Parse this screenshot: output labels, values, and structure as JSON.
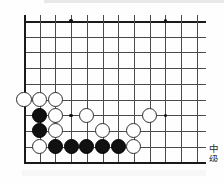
{
  "page": {
    "caption_line1": "中",
    "caption_line2": "级"
  },
  "board": {
    "type": "go-board",
    "origin_x": 24,
    "origin_y": 21,
    "spacing": 15.7,
    "columns": 12,
    "rows": 10,
    "line_color": "#4a4a4a",
    "edge_color": "#1a1a1a",
    "background_color": "#fefefe",
    "star_points": [
      {
        "col": 3,
        "row": 0
      },
      {
        "col": 9,
        "row": 0
      },
      {
        "col": 3,
        "row": 6
      },
      {
        "col": 9,
        "row": 6
      }
    ],
    "stones": [
      {
        "color": "white",
        "col": 0,
        "row": 5
      },
      {
        "color": "white",
        "col": 1,
        "row": 5
      },
      {
        "color": "white",
        "col": 2,
        "row": 5
      },
      {
        "color": "black",
        "col": 1,
        "row": 6
      },
      {
        "color": "white",
        "col": 2,
        "row": 6
      },
      {
        "color": "white",
        "col": 4,
        "row": 6
      },
      {
        "color": "white",
        "col": 8,
        "row": 6
      },
      {
        "color": "black",
        "col": 1,
        "row": 7
      },
      {
        "color": "white",
        "col": 2,
        "row": 7
      },
      {
        "color": "white",
        "col": 5,
        "row": 7
      },
      {
        "color": "white",
        "col": 7,
        "row": 7
      },
      {
        "color": "white",
        "col": 1,
        "row": 8
      },
      {
        "color": "black",
        "col": 2,
        "row": 8
      },
      {
        "color": "black",
        "col": 3,
        "row": 8
      },
      {
        "color": "black",
        "col": 4,
        "row": 8
      },
      {
        "color": "black",
        "col": 5,
        "row": 8
      },
      {
        "color": "black",
        "col": 6,
        "row": 8
      },
      {
        "color": "white",
        "col": 7,
        "row": 8
      }
    ],
    "white_stone_count": 11,
    "black_stone_count": 7
  }
}
